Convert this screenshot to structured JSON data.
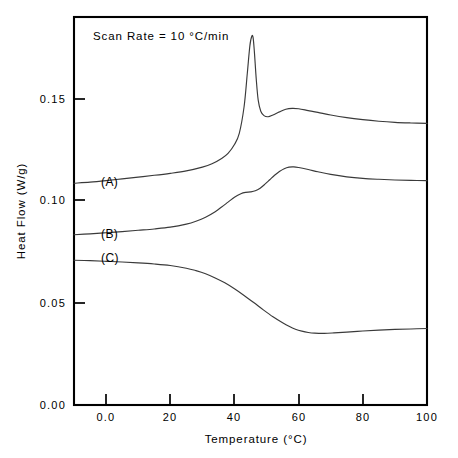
{
  "figure": {
    "background_color": "#ffffff",
    "frame_color": "#000000",
    "curve_color": "#3a3a3a"
  },
  "annotation": {
    "scan_rate_text": "Scan Rate  =  10  °C/min"
  },
  "axes": {
    "x_title": "Temperature   (°C)",
    "y_title": "Heat  Flow  (W/g)",
    "x_ticks": [
      "0.0",
      "20",
      "40",
      "60",
      "80",
      "100"
    ],
    "x_tick_values": [
      0,
      20,
      40,
      60,
      80,
      100
    ],
    "y_ticks": [
      "0.00",
      "0.05",
      "0.10",
      "0.15"
    ],
    "y_tick_values": [
      0.0,
      0.05,
      0.1,
      0.15
    ]
  },
  "curve_labels": {
    "a": "(A)",
    "b": "(B)",
    "c": "(C)"
  },
  "chart_data": {
    "type": "line",
    "title": "",
    "subtitle": "",
    "xlabel": "Temperature   (°C)",
    "ylabel": "Heat  Flow  (W/g)",
    "xlim": [
      -10,
      100
    ],
    "ylim": [
      0.0,
      0.175
    ],
    "grid": false,
    "legend_position": "inline-curve-labels",
    "annotations": [
      {
        "text": "Scan Rate  =  10  °C/min",
        "x": -4.0,
        "y": 0.1695
      },
      {
        "text": "(A)",
        "x": 4.0,
        "y": 0.1105
      },
      {
        "text": "(B)",
        "x": 4.0,
        "y": 0.0855
      },
      {
        "text": "(C)",
        "x": 4.0,
        "y": 0.0735
      }
    ],
    "series": [
      {
        "name": "(A)",
        "x": [
          -10,
          -5,
          0,
          5,
          10,
          15,
          20,
          25,
          30,
          33,
          36,
          38,
          40,
          41.5,
          43,
          44,
          44.8,
          45.4,
          45.8,
          46.2,
          46.8,
          47.4,
          48.2,
          49.2,
          50.5,
          52,
          54,
          56,
          58,
          60,
          63,
          66,
          70,
          75,
          80,
          85,
          90,
          95,
          100
        ],
        "y": [
          0.1,
          0.1005,
          0.1012,
          0.102,
          0.1028,
          0.1036,
          0.1045,
          0.1056,
          0.1073,
          0.1088,
          0.1112,
          0.1135,
          0.1175,
          0.1225,
          0.1345,
          0.1495,
          0.162,
          0.1663,
          0.1658,
          0.1595,
          0.1468,
          0.1375,
          0.1325,
          0.1305,
          0.13,
          0.1308,
          0.1322,
          0.1334,
          0.1338,
          0.1336,
          0.1328,
          0.132,
          0.1308,
          0.1296,
          0.1287,
          0.128,
          0.1275,
          0.1272,
          0.127
        ]
      },
      {
        "name": "(B)",
        "x": [
          -10,
          -5,
          0,
          5,
          10,
          15,
          20,
          25,
          28,
          31,
          34,
          36,
          38,
          40,
          42,
          43.5,
          45,
          46.5,
          48,
          49.5,
          51,
          52.5,
          54,
          55.5,
          57,
          58.5,
          60,
          63,
          66,
          70,
          75,
          80,
          85,
          90,
          95,
          100
        ],
        "y": [
          0.0768,
          0.0772,
          0.0777,
          0.0782,
          0.0788,
          0.0794,
          0.0802,
          0.0816,
          0.0829,
          0.0847,
          0.0872,
          0.0893,
          0.0915,
          0.0937,
          0.0953,
          0.0959,
          0.0961,
          0.0966,
          0.0978,
          0.0996,
          0.1016,
          0.1036,
          0.1053,
          0.1066,
          0.1073,
          0.1074,
          0.1071,
          0.1062,
          0.1052,
          0.104,
          0.1029,
          0.1022,
          0.1018,
          0.1015,
          0.1013,
          0.1012
        ]
      },
      {
        "name": "(C)",
        "x": [
          -10,
          -5,
          0,
          5,
          10,
          15,
          20,
          25,
          28,
          31,
          34,
          37,
          40,
          43,
          46,
          49,
          52,
          55,
          57,
          59,
          61,
          63,
          65,
          68,
          71,
          75,
          80,
          85,
          90,
          95,
          100
        ],
        "y": [
          0.0653,
          0.0651,
          0.0648,
          0.0645,
          0.0641,
          0.0636,
          0.0629,
          0.0617,
          0.0606,
          0.0592,
          0.0573,
          0.0551,
          0.0524,
          0.0494,
          0.0462,
          0.0429,
          0.0398,
          0.0371,
          0.0355,
          0.0342,
          0.0333,
          0.0327,
          0.0324,
          0.0323,
          0.0325,
          0.0329,
          0.0334,
          0.0338,
          0.0341,
          0.0343,
          0.0345
        ]
      }
    ],
    "features": {
      "curve_a_peak": {
        "x": 45.7,
        "y": 0.1663
      },
      "curve_a_shoulder": {
        "x": 57.5,
        "y": 0.1338
      },
      "curve_b_peak": {
        "x": 58.0,
        "y": 0.1074
      },
      "curve_c_minimum": {
        "x": 66.5,
        "y": 0.0323
      }
    }
  }
}
